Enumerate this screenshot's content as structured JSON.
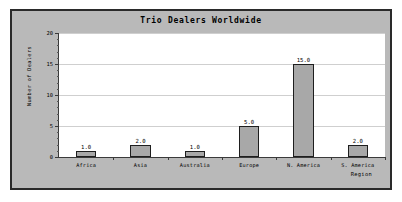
{
  "chart_data": {
    "type": "bar",
    "title": "Trio Dealers Worldwide",
    "xlabel": "Region",
    "ylabel": "Number of Dealers",
    "categories": [
      "Africa",
      "Asia",
      "Australia",
      "Europe",
      "N. America",
      "S. America"
    ],
    "values": [
      1.0,
      2.0,
      1.0,
      5.0,
      15.0,
      2.0
    ],
    "value_labels": [
      "1.0",
      "2.0",
      "1.0",
      "5.0",
      "15.0",
      "2.0"
    ],
    "ylim": [
      0,
      20
    ],
    "y_ticks": [
      0,
      5,
      10,
      15,
      20
    ],
    "y_tick_labels": [
      "0",
      "5",
      "10",
      "15",
      "20"
    ],
    "y_minor_tick_step": 1,
    "grid": true,
    "legend": false,
    "colors": {
      "figure_background": "#b9b9b9",
      "plot_background": "#ffffff",
      "bar_fill": "#a8a8a8",
      "bar_edge": "#1e1e1e",
      "axis": "#3a3a3a",
      "gridline": "#cfcfcf",
      "frame_border": "#2a2a2a",
      "text": "#000000"
    }
  }
}
